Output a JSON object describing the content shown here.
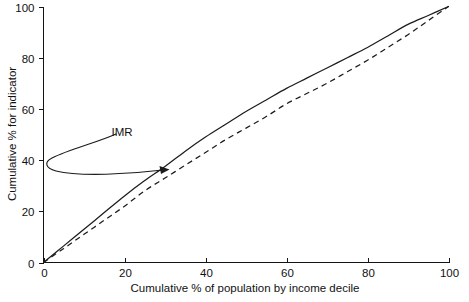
{
  "chart_data": {
    "type": "line",
    "title": "",
    "xlabel": "Cumulative % of population by income decile",
    "ylabel": "Cumulative % for indicator",
    "xlim": [
      0,
      100
    ],
    "ylim": [
      0,
      100
    ],
    "xticks": [
      0,
      20,
      40,
      60,
      80,
      100
    ],
    "yticks": [
      0,
      20,
      40,
      60,
      80,
      100
    ],
    "xticklabels": [
      "0",
      "20",
      "40",
      "60",
      "80",
      "100"
    ],
    "yticklabels": [
      "0",
      "20",
      "40",
      "60",
      "80",
      "100"
    ],
    "grid": false,
    "legend": false,
    "legend_position": "none",
    "series": [
      {
        "name": "IMR",
        "style": "solid",
        "color": "#1c1c1c",
        "x": [
          0,
          5,
          10,
          15,
          20,
          25,
          30,
          35,
          40,
          45,
          50,
          55,
          60,
          65,
          70,
          75,
          80,
          85,
          90,
          95,
          100
        ],
        "values": [
          0,
          6.5,
          13,
          19.5,
          26,
          32,
          37.5,
          43.5,
          49,
          54,
          59,
          63.5,
          68,
          72,
          76,
          80,
          84,
          88.5,
          93,
          96.5,
          100
        ]
      },
      {
        "name": "Reference (dashed)",
        "style": "dashed",
        "color": "#1c1c1c",
        "x": [
          0,
          5,
          10,
          15,
          20,
          25,
          30,
          35,
          40,
          45,
          50,
          55,
          60,
          65,
          70,
          75,
          80,
          85,
          90,
          95,
          100
        ],
        "values": [
          0,
          5.5,
          11,
          16.5,
          22,
          28,
          33,
          38,
          43,
          48,
          52.5,
          57,
          62,
          66,
          70,
          74.5,
          79,
          84,
          89,
          94.5,
          100
        ]
      }
    ],
    "annotations": [
      {
        "label": "IMR",
        "text_x": 15.4,
        "text_y": 50.0,
        "points_to_x": 30.8,
        "points_to_y": 36.5
      }
    ]
  },
  "axes": {
    "x_axis_name": "x-axis",
    "y_axis_name": "y-axis"
  }
}
